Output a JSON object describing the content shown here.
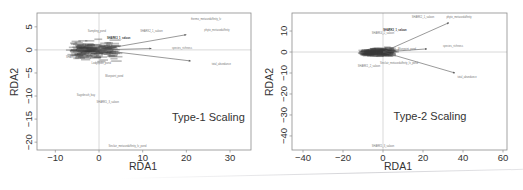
{
  "chart_data": [
    {
      "type": "scatter",
      "subtype": "rda-biplot",
      "title": "",
      "annotation": "Type-1 Scaling",
      "xlabel": "RDA1",
      "ylabel": "RDA2",
      "xlim": [
        -14.2,
        34.8
      ],
      "ylim": [
        -21.7,
        8.0
      ],
      "xticks": [
        -10,
        0,
        10,
        20,
        30
      ],
      "yticks": [
        5,
        0,
        -5,
        -10,
        -15,
        -20
      ],
      "grid": false,
      "reference_lines": {
        "x": 0,
        "y": 0
      },
      "frame_px": {
        "left": 37,
        "top": 13,
        "right": 251,
        "bottom": 150
      },
      "arrows": [
        {
          "label": "phyto_metasedaffinity",
          "x": 20.0,
          "y": 3.3
        },
        {
          "label": "species_richness",
          "x": 12.0,
          "y": 0.3
        },
        {
          "label": "total_abundance",
          "x": 21.0,
          "y": -2.4
        }
      ],
      "arrow_labels": [
        {
          "text": "phyto_metasedaffinity",
          "x": 27.0,
          "y": 4.3
        },
        {
          "text": "species_richness",
          "x": 19.0,
          "y": 0.5
        },
        {
          "text": "total_abundance",
          "x": 28.0,
          "y": -3.1
        },
        {
          "text": "thermo_metasedaffinity_lv",
          "x": 24.5,
          "y": 6.8
        }
      ],
      "site_labels": [
        {
          "text": "SHARK2_1_saloon",
          "x": 12.0,
          "y": 4.2
        },
        {
          "text": "Sampling_pond",
          "x": -0.5,
          "y": 4.1
        },
        {
          "text": "SHARK3_1_saloon",
          "x": 4.5,
          "y": 2.5,
          "bold": true
        },
        {
          "text": "Bluepoint_pond",
          "x": 3.5,
          "y": -5.6
        },
        {
          "text": "Sagebrush_bay",
          "x": -3.0,
          "y": -9.8
        },
        {
          "text": "SHARK5_3_saloon",
          "x": 2.0,
          "y": -11.4
        },
        {
          "text": "Sinclair_metasedaffinity_lv_pond",
          "x": 6.5,
          "y": -20.9
        },
        {
          "text": "SHARK1_2_saloon",
          "x": -5.0,
          "y": -1.6
        },
        {
          "text": "Lodgepole_pond",
          "x": 0.5,
          "y": -2.8
        }
      ],
      "cluster": {
        "x_range": [
          -6,
          4
        ],
        "y_range": [
          -3,
          3
        ],
        "n_points": 140
      }
    },
    {
      "type": "scatter",
      "subtype": "rda-biplot",
      "title": "",
      "annotation": "Type-2 Scaling",
      "xlabel": "RDA1",
      "ylabel": "RDA2",
      "xlim": [
        -45.5,
        62.0
      ],
      "ylim": [
        -46.7,
        18.6
      ],
      "xticks": [
        -40,
        -20,
        0,
        20,
        40,
        60
      ],
      "yticks": [
        10,
        0,
        -10,
        -20,
        -30,
        -40
      ],
      "grid": false,
      "reference_lines": {
        "x": 0,
        "y": 0
      },
      "frame_px": {
        "left": 292,
        "top": 13,
        "right": 507,
        "bottom": 150
      },
      "arrows": [
        {
          "label": "phyto_metasedaffinity",
          "x": 33.0,
          "y": 14.0
        },
        {
          "label": "species_richness",
          "x": 22.0,
          "y": 1.5
        },
        {
          "label": "total_abundance",
          "x": 36.0,
          "y": -10.0
        }
      ],
      "arrow_labels": [
        {
          "text": "phyto_metasedaffinity",
          "x": 38.0,
          "y": 16.5
        },
        {
          "text": "species_richness",
          "x": 35.0,
          "y": 3.0
        },
        {
          "text": "total_abundance",
          "x": 42.0,
          "y": -12.0
        }
      ],
      "site_labels": [
        {
          "text": "SHARK2_1_saloon",
          "x": 20.0,
          "y": 16.5
        },
        {
          "text": "SHARK3_1_saloon",
          "x": 6.0,
          "y": 10.5,
          "bold": true
        },
        {
          "text": "SHARK4_2_saloon",
          "x": 0.0,
          "y": 9.0
        },
        {
          "text": "Bluepoint_pond",
          "x": 12.0,
          "y": 1.5
        },
        {
          "text": "Sinclair_metasedaffinity_lv_pond",
          "x": 8.0,
          "y": -5.0
        },
        {
          "text": "SHARK1_2_saloon",
          "x": -7.0,
          "y": -6.5
        },
        {
          "text": "SHARK5_3_saloon",
          "x": 0.0,
          "y": -45.0
        }
      ],
      "cluster": {
        "x_range": [
          -10,
          5
        ],
        "y_range": [
          -3,
          3
        ],
        "n_points": 140
      }
    }
  ],
  "colors": {
    "frame": "#8c8c8c",
    "refline": "#c8c8c8",
    "arrow": "#555555",
    "cluster": "#3a3a3a",
    "label": "#777777",
    "axis_text": "#333333",
    "annotation_text": "#333333"
  },
  "plots": [
    {
      "annotation": "Type-1 Scaling",
      "xlabel": "RDA1",
      "ylabel": "RDA2"
    },
    {
      "annotation": "Type-2 Scaling",
      "xlabel": "RDA1",
      "ylabel": "RDA2"
    }
  ]
}
